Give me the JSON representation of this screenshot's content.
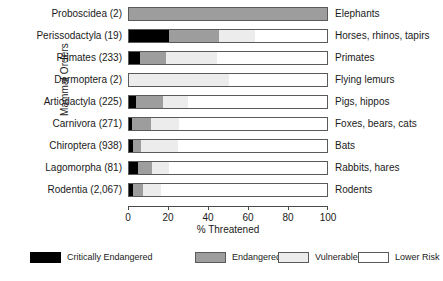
{
  "chart_data": {
    "type": "bar",
    "orientation": "horizontal",
    "stacked": true,
    "stacked_percent": true,
    "title": "",
    "xlabel": "% Threatened",
    "ylabel": "Mammal Orders",
    "xlim": [
      0,
      100
    ],
    "xticks": [
      0,
      20,
      40,
      60,
      80,
      100
    ],
    "xticklabels": [
      "0",
      "20",
      "40",
      "60",
      "80",
      "100"
    ],
    "grid": false,
    "legend_position": "bottom",
    "categories": [
      "Proboscidea (2)",
      "Perissodactyla (19)",
      "Primates (233)",
      "Dermoptera (2)",
      "Artiodactyla (225)",
      "Carnivora (271)",
      "Chiroptera (938)",
      "Lagomorpha (81)",
      "Rodentia (2,067)"
    ],
    "right_labels": [
      "Elephants",
      "Horses, rhinos, tapirs",
      "Primates",
      "Flying lemurs",
      "Pigs, hippos",
      "Foxes, bears, cats",
      "Bats",
      "Rabbits, hares",
      "Rodents"
    ],
    "series": [
      {
        "name": "Critically Endangered",
        "color": "#000000",
        "values": [
          0,
          20,
          5.5,
          0,
          3.5,
          1.5,
          2,
          4.5,
          2
        ]
      },
      {
        "name": "Endangered",
        "color": "#9d9d9d",
        "values": [
          100,
          25,
          13,
          0,
          13.5,
          9.5,
          4,
          7,
          5
        ]
      },
      {
        "name": "Vulnerable",
        "color": "#ececec",
        "values": [
          0,
          18,
          25.5,
          50,
          12.5,
          14,
          18.5,
          8.5,
          9
        ]
      },
      {
        "name": "Lower Risk",
        "color": "#ffffff",
        "values": [
          0,
          37,
          56,
          50,
          70.5,
          75,
          75.5,
          80,
          84
        ]
      }
    ],
    "legend": [
      {
        "label": "Critically Endangered",
        "color": "#000000"
      },
      {
        "label": "Endangered",
        "color": "#9d9d9d"
      },
      {
        "label": "Vulnerable",
        "color": "#ececec"
      },
      {
        "label": "Lower Risk",
        "color": "#ffffff"
      }
    ]
  }
}
